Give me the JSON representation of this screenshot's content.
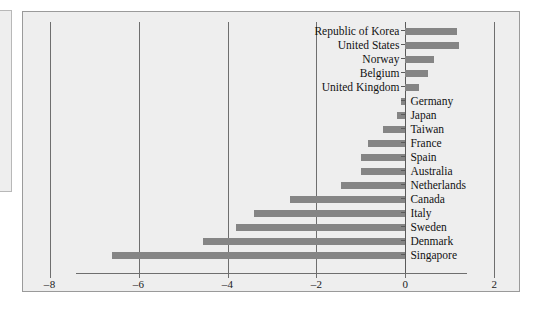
{
  "chart_data": {
    "type": "bar",
    "orientation": "horizontal",
    "title": "",
    "xlabel": "",
    "ylabel": "",
    "xlim": [
      -8.6,
      2.6
    ],
    "xticks": [
      -8,
      -6,
      -4,
      -2,
      0,
      2
    ],
    "xticklabels": [
      "–8",
      "–6",
      "–4",
      "–2",
      "0",
      "2"
    ],
    "grid": true,
    "gridlines_at": [
      -8,
      -6,
      -4,
      -2,
      0,
      2
    ],
    "legend": "none",
    "bar_color": "#858585",
    "categories": [
      "Republic of Korea",
      "United States",
      "Norway",
      "Belgium",
      "United Kingdom",
      "Germany",
      "Japan",
      "Taiwan",
      "France",
      "Spain",
      "Australia",
      "Netherlands",
      "Canada",
      "Italy",
      "Sweden",
      "Denmark",
      "Singapore"
    ],
    "values": [
      1.15,
      1.2,
      0.65,
      0.5,
      0.3,
      -0.1,
      -0.2,
      -0.5,
      -0.85,
      -1.0,
      -1.0,
      -1.45,
      -2.6,
      -3.4,
      -3.8,
      -4.55,
      -6.6
    ]
  },
  "axis": {
    "tick_labels": [
      "–8",
      "–6",
      "–4",
      "–2",
      "0",
      "2"
    ]
  }
}
